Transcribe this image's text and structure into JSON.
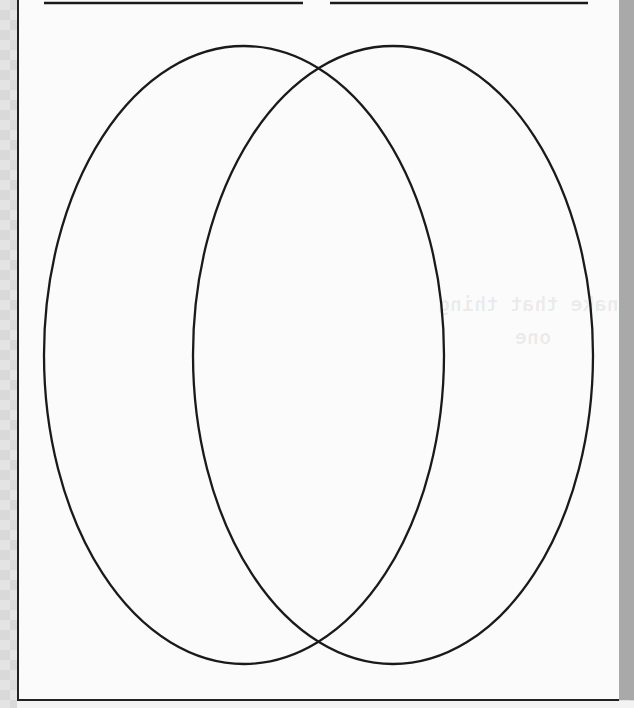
{
  "document": {
    "type": "venn-diagram-worksheet",
    "background": "#fbfbfb",
    "stroke_color": "#1a1a1a",
    "title_lines": [
      {
        "label": "left-circle-title-line",
        "x1": 44,
        "x2": 303,
        "y": 3
      },
      {
        "label": "right-circle-title-line",
        "x1": 330,
        "x2": 588,
        "y": 3
      }
    ],
    "circles": [
      {
        "name": "left",
        "cx": 244,
        "cy": 355,
        "rx": 200,
        "ry": 309
      },
      {
        "name": "right",
        "cx": 393,
        "cy": 355,
        "rx": 200,
        "ry": 309
      }
    ],
    "bleed_through_text": [
      "nake that thing",
      "one"
    ]
  }
}
